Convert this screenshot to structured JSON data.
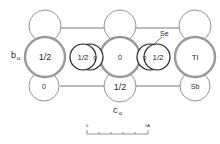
{
  "diagram": {
    "axis_labels": {
      "b": "b",
      "b_sub": "o",
      "c": "c",
      "c_sub": "o"
    },
    "atoms": {
      "top_row": [
        {
          "id": "top-left",
          "label": ""
        },
        {
          "id": "top-center",
          "label": ""
        },
        {
          "id": "top-right",
          "label": ""
        }
      ],
      "middle_row": [
        {
          "id": "mid-left",
          "label": "1/2"
        },
        {
          "id": "se-left",
          "label": "1/2",
          "small_label": "0"
        },
        {
          "id": "mid-center",
          "label": "0"
        },
        {
          "id": "se-right",
          "label": "1/2",
          "small_label": "0"
        },
        {
          "id": "mid-right",
          "label": "Tl"
        }
      ],
      "bottom_row": [
        {
          "id": "bot-left",
          "label": "0"
        },
        {
          "id": "bot-center",
          "label": "1/2"
        },
        {
          "id": "bot-right",
          "label": "Sb"
        }
      ]
    },
    "callout": "Se",
    "scale_bar": {
      "start": "0",
      "end": "5A"
    }
  }
}
